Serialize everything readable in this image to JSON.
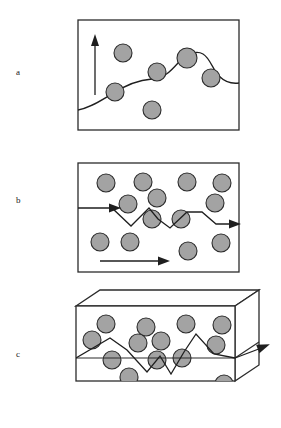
{
  "figure": {
    "title": "",
    "background_color": "#ffffff",
    "width": 281,
    "height": 428,
    "particle_fill": "#a3a3a3",
    "particle_stroke": "#2b2b2b",
    "line_color": "#1f1f1f",
    "frame_color": "#2b2b2b"
  },
  "panels": [
    {
      "id": "a",
      "label": "a",
      "label_x": 16,
      "label_y": 68,
      "type": "2d-rectangle",
      "frame": {
        "x": 78,
        "y": 20,
        "width": 161,
        "height": 110
      },
      "description": "Rectangular frame with an upward arrow at left, a wavy surface-like curve passing through scattered particles",
      "up_arrow": {
        "x": 95,
        "y_start": 95,
        "y_end": 38
      },
      "wave_path": "M 78,110 C 90,108 100,101 112,94 C 124,86 138,80 152,79 C 164,78 170,72 178,63 C 186,54 196,50 203,54 C 210,58 213,70 219,76 C 226,83 232,84 239,83",
      "particles": [
        {
          "cx": 123,
          "cy": 53,
          "r": 9
        },
        {
          "cx": 115,
          "cy": 92,
          "r": 9
        },
        {
          "cx": 157,
          "cy": 72,
          "r": 9
        },
        {
          "cx": 187,
          "cy": 58,
          "r": 10
        },
        {
          "cx": 211,
          "cy": 78,
          "r": 9
        },
        {
          "cx": 152,
          "cy": 110,
          "r": 9
        }
      ]
    },
    {
      "id": "b",
      "label": "b",
      "label_x": 16,
      "label_y": 196,
      "type": "2d-rectangle",
      "frame": {
        "x": 78,
        "y": 163,
        "width": 161,
        "height": 109
      },
      "description": "Rectangular frame with a zigzag ray entering from the left and exiting right through a field of particles, plus a straight direction arrow at the bottom",
      "zigzag_path": "M 78,208 L 112,208 L 131,226 L 149,208 L 158,219 L 170,228 L 187,212 L 202,212 L 216,224 L 233,224",
      "entry_arrow_head": {
        "x": 112,
        "y": 208
      },
      "exit_arrow_head": {
        "x": 239,
        "y": 224
      },
      "bottom_arrow": {
        "x_start": 100,
        "x_end": 168,
        "y": 261
      },
      "particles": [
        {
          "cx": 106,
          "cy": 183,
          "r": 9
        },
        {
          "cx": 143,
          "cy": 182,
          "r": 9
        },
        {
          "cx": 187,
          "cy": 182,
          "r": 9
        },
        {
          "cx": 222,
          "cy": 183,
          "r": 9
        },
        {
          "cx": 128,
          "cy": 204,
          "r": 9
        },
        {
          "cx": 157,
          "cy": 198,
          "r": 9
        },
        {
          "cx": 215,
          "cy": 203,
          "r": 9
        },
        {
          "cx": 152,
          "cy": 219,
          "r": 9
        },
        {
          "cx": 181,
          "cy": 219,
          "r": 9
        },
        {
          "cx": 100,
          "cy": 242,
          "r": 9
        },
        {
          "cx": 130,
          "cy": 242,
          "r": 9
        },
        {
          "cx": 188,
          "cy": 251,
          "r": 9
        },
        {
          "cx": 221,
          "cy": 243,
          "r": 9
        }
      ]
    },
    {
      "id": "c",
      "label": "c",
      "label_x": 16,
      "label_y": 350,
      "type": "3d-box",
      "description": "Three-dimensional slab containing particles; a zigzag ray travels along a central plane and exits to the upper right as an arrow",
      "box": {
        "front_face": {
          "x": 76,
          "y": 306,
          "width": 159,
          "height": 75
        },
        "depth_x": 24,
        "depth_y": -16
      },
      "divider_line": {
        "x_start": 76,
        "x_end": 235,
        "y": 358
      },
      "zigzag_path": "M 76,358 L 110,338 L 127,350 L 147,372 L 160,356 L 171,374 L 184,352 L 196,334 L 214,354 L 235,358",
      "exit_arrow": {
        "x_start": 235,
        "y_start": 358,
        "x_end": 268,
        "y_end": 345
      },
      "particles": [
        {
          "cx": 106,
          "cy": 324,
          "r": 9
        },
        {
          "cx": 146,
          "cy": 327,
          "r": 9
        },
        {
          "cx": 186,
          "cy": 324,
          "r": 9
        },
        {
          "cx": 222,
          "cy": 325,
          "r": 9
        },
        {
          "cx": 92,
          "cy": 340,
          "r": 9
        },
        {
          "cx": 138,
          "cy": 343,
          "r": 9
        },
        {
          "cx": 161,
          "cy": 341,
          "r": 9
        },
        {
          "cx": 216,
          "cy": 345,
          "r": 9
        },
        {
          "cx": 112,
          "cy": 360,
          "r": 9
        },
        {
          "cx": 157,
          "cy": 360,
          "r": 9
        },
        {
          "cx": 182,
          "cy": 358,
          "r": 9
        },
        {
          "cx": 129,
          "cy": 377,
          "r": 9
        },
        {
          "cx": 99,
          "cy": 392,
          "r": 9
        },
        {
          "cx": 189,
          "cy": 392,
          "r": 9
        },
        {
          "cx": 224,
          "cy": 384,
          "r": 9
        }
      ]
    }
  ]
}
